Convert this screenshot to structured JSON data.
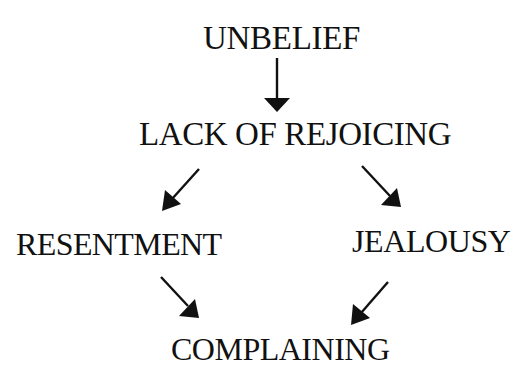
{
  "diagram": {
    "type": "flow",
    "background": "#ffffff",
    "ink_color": "#111111",
    "nodes": {
      "unbelief": "UNBELIEF",
      "lack_of_rejoicing": "LACK OF REJOICING",
      "resentment": "RESENTMENT",
      "jealousy": "JEALOUSY",
      "complaining": "COMPLAINING"
    },
    "edges": [
      {
        "from": "UNBELIEF",
        "to": "LACK OF REJOICING"
      },
      {
        "from": "LACK OF REJOICING",
        "to": "RESENTMENT"
      },
      {
        "from": "LACK OF REJOICING",
        "to": "JEALOUSY"
      },
      {
        "from": "RESENTMENT",
        "to": "COMPLAINING"
      },
      {
        "from": "JEALOUSY",
        "to": "COMPLAINING"
      }
    ]
  }
}
